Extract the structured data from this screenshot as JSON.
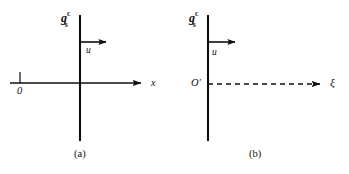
{
  "figure": {
    "panels": [
      {
        "id": "a",
        "caption": "(a)",
        "field_label": {
          "base": "g",
          "superscript": "c",
          "subscript": "s"
        },
        "origin_label": "0",
        "axis_label": "x",
        "velocity_label": "u",
        "axis_style": "solid",
        "has_origin_tick": true,
        "geometry": {
          "vertical_line_x": 80,
          "vertical_line_y1": 15,
          "vertical_line_y2": 141,
          "axis_y": 83,
          "axis_x1": 10,
          "axis_x2": 148,
          "origin_tick_x": 20,
          "u_arrow_y": 42,
          "u_arrow_x1": 80,
          "u_arrow_x2": 112
        }
      },
      {
        "id": "b",
        "caption": "(b)",
        "field_label": {
          "base": "g",
          "superscript": "c",
          "subscript": "s"
        },
        "origin_label": "O′",
        "axis_label": "ξ",
        "velocity_label": "u",
        "axis_style": "dashed",
        "has_origin_tick": false,
        "geometry": {
          "vertical_line_x": 33,
          "vertical_line_y1": 15,
          "vertical_line_y2": 141,
          "axis_y": 84,
          "axis_x1": 33,
          "axis_x2": 152,
          "u_arrow_y": 42,
          "u_arrow_x1": 33,
          "u_arrow_x2": 66
        }
      }
    ],
    "colors": {
      "ink": "#100f10",
      "background": "#ffffff"
    }
  }
}
